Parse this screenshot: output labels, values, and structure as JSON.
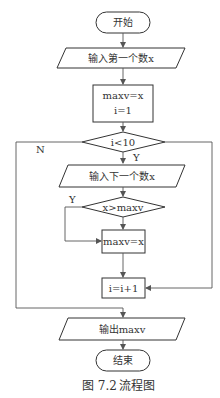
{
  "flowchart": {
    "start": "开始",
    "input_first": "输入第一个数x",
    "init_line1": "maxv=x",
    "init_line2": "i=1",
    "loop_condition": "i<10",
    "loop_yes": "Y",
    "loop_no": "N",
    "input_next": "输入下一个数x",
    "compare_condition": "x>maxv",
    "compare_yes": "Y",
    "assign": "maxv=x",
    "increment": "i=i+1",
    "output": "输出maxv",
    "end": "结束"
  },
  "caption": {
    "figure_number": "图 7.2",
    "title": "流程图"
  },
  "colors": {
    "stroke": "#333333",
    "background": "#ffffff"
  }
}
